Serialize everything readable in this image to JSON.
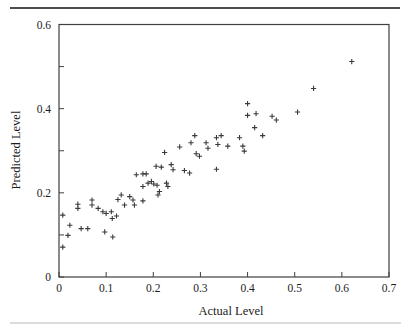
{
  "chart_data": {
    "type": "scatter",
    "title": "",
    "xlabel": "Actual Level",
    "ylabel": "Predicted Level",
    "xlim": [
      0,
      0.7
    ],
    "ylim": [
      0,
      0.6
    ],
    "x_ticks": [
      0,
      0.1,
      0.2,
      0.3,
      0.4,
      0.5,
      0.6,
      0.7
    ],
    "x_tick_labels": [
      "0",
      "0.1",
      "0.2",
      "0.3",
      "0.4",
      "0.5",
      "0.6",
      "0.7"
    ],
    "y_ticks": [
      0,
      0.1,
      0.2,
      0.3,
      0.4,
      0.5,
      0.6
    ],
    "y_tick_labels": [
      "0",
      "",
      "0.2",
      "",
      "0.4",
      "",
      "0.6"
    ],
    "grid": false,
    "legend": null,
    "marker": "+",
    "marker_color": "#3a3a3a",
    "frame_color": "#3f3f3f",
    "points": [
      [
        0.008,
        0.147
      ],
      [
        0.023,
        0.123
      ],
      [
        0.019,
        0.099
      ],
      [
        0.008,
        0.071
      ],
      [
        0.04,
        0.173
      ],
      [
        0.04,
        0.163
      ],
      [
        0.07,
        0.183
      ],
      [
        0.07,
        0.171
      ],
      [
        0.083,
        0.163
      ],
      [
        0.093,
        0.155
      ],
      [
        0.1,
        0.151
      ],
      [
        0.111,
        0.155
      ],
      [
        0.122,
        0.145
      ],
      [
        0.113,
        0.139
      ],
      [
        0.047,
        0.115
      ],
      [
        0.061,
        0.115
      ],
      [
        0.097,
        0.107
      ],
      [
        0.114,
        0.095
      ],
      [
        0.125,
        0.184
      ],
      [
        0.132,
        0.195
      ],
      [
        0.15,
        0.191
      ],
      [
        0.157,
        0.183
      ],
      [
        0.178,
        0.181
      ],
      [
        0.139,
        0.171
      ],
      [
        0.16,
        0.171
      ],
      [
        0.164,
        0.243
      ],
      [
        0.178,
        0.245
      ],
      [
        0.185,
        0.245
      ],
      [
        0.196,
        0.227
      ],
      [
        0.189,
        0.223
      ],
      [
        0.201,
        0.221
      ],
      [
        0.208,
        0.218
      ],
      [
        0.178,
        0.215
      ],
      [
        0.228,
        0.223
      ],
      [
        0.231,
        0.215
      ],
      [
        0.213,
        0.203
      ],
      [
        0.21,
        0.195
      ],
      [
        0.206,
        0.263
      ],
      [
        0.217,
        0.261
      ],
      [
        0.238,
        0.267
      ],
      [
        0.242,
        0.255
      ],
      [
        0.266,
        0.253
      ],
      [
        0.277,
        0.247
      ],
      [
        0.334,
        0.256
      ],
      [
        0.224,
        0.296
      ],
      [
        0.256,
        0.309
      ],
      [
        0.28,
        0.319
      ],
      [
        0.288,
        0.336
      ],
      [
        0.291,
        0.293
      ],
      [
        0.298,
        0.287
      ],
      [
        0.312,
        0.319
      ],
      [
        0.316,
        0.306
      ],
      [
        0.334,
        0.331
      ],
      [
        0.344,
        0.336
      ],
      [
        0.337,
        0.315
      ],
      [
        0.358,
        0.311
      ],
      [
        0.383,
        0.331
      ],
      [
        0.39,
        0.311
      ],
      [
        0.393,
        0.299
      ],
      [
        0.432,
        0.336
      ],
      [
        0.4,
        0.412
      ],
      [
        0.4,
        0.384
      ],
      [
        0.418,
        0.388
      ],
      [
        0.415,
        0.355
      ],
      [
        0.452,
        0.382
      ],
      [
        0.461,
        0.373
      ],
      [
        0.506,
        0.392
      ],
      [
        0.54,
        0.448
      ],
      [
        0.621,
        0.512
      ]
    ]
  }
}
